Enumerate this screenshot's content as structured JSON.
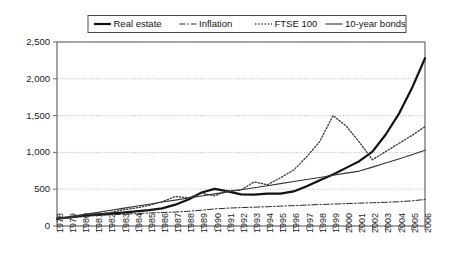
{
  "chart_data": {
    "type": "line",
    "title": "",
    "subtitle": "",
    "xlabel": "",
    "ylabel": "",
    "xlim": [
      1978,
      2006
    ],
    "ylim": [
      0,
      2500
    ],
    "grid": true,
    "legend_position": "top-center",
    "ytick_labels": [
      "0",
      "500",
      "1,000",
      "1,500",
      "2,000",
      "2,500"
    ],
    "ytick_values": [
      0,
      500,
      1000,
      1500,
      2000,
      2500
    ],
    "x": [
      1978,
      1979,
      1980,
      1981,
      1982,
      1983,
      1984,
      1985,
      1986,
      1987,
      1988,
      1989,
      1990,
      1991,
      1992,
      1993,
      1994,
      1995,
      1996,
      1997,
      1998,
      1999,
      2000,
      2001,
      2002,
      2003,
      2004,
      2005,
      2006
    ],
    "xtick_labels": [
      "1978",
      "1979",
      "1980",
      "1981",
      "1982",
      "1983",
      "1984",
      "1985",
      "1986",
      "1987",
      "1988",
      "1989",
      "1990",
      "1991",
      "1992",
      "1993",
      "1994",
      "1995",
      "1996",
      "1997",
      "1998",
      "1999",
      "2000",
      "2001",
      "2002",
      "2003",
      "2004",
      "2005",
      "2006"
    ],
    "series": [
      {
        "name": "Real estate",
        "style": "solid-thick",
        "color": "#111111",
        "width": 2.2,
        "dash": "none",
        "values": [
          100,
          118,
          140,
          155,
          168,
          182,
          198,
          215,
          240,
          290,
          360,
          455,
          505,
          470,
          430,
          425,
          440,
          440,
          470,
          540,
          620,
          700,
          790,
          880,
          1010,
          1240,
          1520,
          1870,
          2280
        ]
      },
      {
        "name": "Inflation",
        "style": "dash-dot",
        "color": "#2a2a2a",
        "width": 1.0,
        "dash": "6 2 1.6 2",
        "values": [
          100,
          112,
          128,
          142,
          152,
          160,
          168,
          177,
          183,
          190,
          200,
          215,
          232,
          243,
          250,
          256,
          262,
          270,
          277,
          284,
          292,
          298,
          304,
          311,
          316,
          322,
          330,
          342,
          360
        ]
      },
      {
        "name": "FTSE 100",
        "style": "dotted",
        "color": "#3a3a3a",
        "width": 1.3,
        "dash": "1.4 1.8",
        "values": [
          100,
          120,
          150,
          165,
          180,
          220,
          245,
          280,
          330,
          400,
          385,
          445,
          410,
          480,
          490,
          600,
          560,
          655,
          760,
          940,
          1150,
          1500,
          1360,
          1140,
          900,
          1010,
          1120,
          1230,
          1350
        ]
      },
      {
        "name": "10-year bonds",
        "style": "solid-thin",
        "color": "#333333",
        "width": 1.1,
        "dash": "none",
        "values": [
          100,
          128,
          155,
          182,
          210,
          240,
          268,
          296,
          325,
          352,
          380,
          408,
          437,
          464,
          492,
          520,
          548,
          576,
          604,
          632,
          660,
          690,
          718,
          746,
          800,
          855,
          910,
          968,
          1030
        ]
      }
    ]
  },
  "legend": {
    "items": [
      {
        "label": "Real estate"
      },
      {
        "label": "Inflation"
      },
      {
        "label": "FTSE 100"
      },
      {
        "label": "10-year bonds"
      }
    ]
  }
}
